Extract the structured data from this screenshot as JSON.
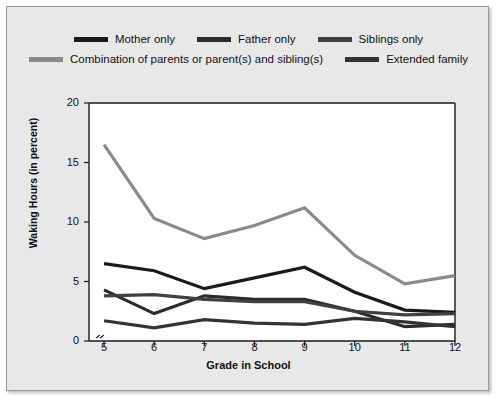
{
  "figure": {
    "background": "#e8e8e8",
    "plot_background": "#ffffff",
    "border_color": "#9a9a9a"
  },
  "legend": {
    "rows": [
      [
        {
          "label": "Mother only",
          "color": "#1a1a1a",
          "swatch": "legend-swatch-mother-only"
        },
        {
          "label": "Father only",
          "color": "#2b2b2b",
          "swatch": "legend-swatch-father-only"
        },
        {
          "label": "Siblings only",
          "color": "#404040",
          "swatch": "legend-swatch-siblings-only"
        }
      ],
      [
        {
          "label": "Combination of parents or parent(s) and sibling(s)",
          "color": "#8a8a8a",
          "swatch": "legend-swatch-combination"
        },
        {
          "label": "Extended family",
          "color": "#333333",
          "swatch": "legend-swatch-extended-family"
        }
      ]
    ]
  },
  "chart_data": {
    "type": "line",
    "title": "",
    "xlabel": "Grade in School",
    "ylabel": "Waking Hours (in percent)",
    "x": [
      5,
      6,
      7,
      8,
      9,
      10,
      11,
      12
    ],
    "xticklabels": [
      "5",
      "6",
      "7",
      "8",
      "9",
      "10",
      "11",
      "12"
    ],
    "yticks": [
      0,
      5,
      10,
      15,
      20
    ],
    "yticklabels": [
      "0",
      "5",
      "10",
      "15",
      "20"
    ],
    "xlim": [
      4.7,
      12
    ],
    "ylim": [
      0,
      20
    ],
    "grid": false,
    "legend_position": "above-axes",
    "series": [
      {
        "name": "Mother only",
        "color": "#1a1a1a",
        "values": [
          6.5,
          5.9,
          4.4,
          5.3,
          6.2,
          4.1,
          2.6,
          2.4
        ]
      },
      {
        "name": "Father only",
        "color": "#2b2b2b",
        "values": [
          4.3,
          2.3,
          3.8,
          3.5,
          3.5,
          2.5,
          1.2,
          1.4
        ]
      },
      {
        "name": "Siblings only",
        "color": "#404040",
        "values": [
          3.8,
          3.9,
          3.5,
          3.3,
          3.3,
          2.5,
          2.2,
          2.3
        ]
      },
      {
        "name": "Combination of parents or parent(s) and sibling(s)",
        "color": "#8a8a8a",
        "values": [
          16.5,
          10.3,
          8.6,
          9.7,
          11.2,
          7.2,
          4.8,
          5.5
        ]
      },
      {
        "name": "Extended family",
        "color": "#333333",
        "values": [
          1.7,
          1.1,
          1.8,
          1.5,
          1.4,
          1.9,
          1.6,
          1.2
        ]
      }
    ]
  }
}
